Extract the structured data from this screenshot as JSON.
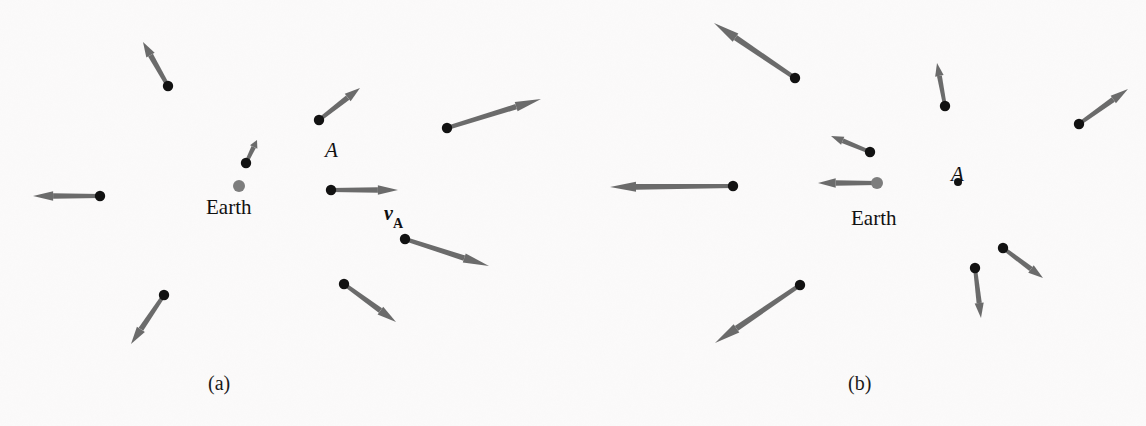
{
  "figure": {
    "background_color": "#fbfafa",
    "galaxy_dot_color": "#121212",
    "earth_dot_color": "#7d7d7d",
    "arrow_color": "#6b6b6b"
  },
  "panels": [
    {
      "id": "a",
      "caption": "(a)",
      "caption_x": 208,
      "caption_y": 372,
      "frame_label": "Earth",
      "labels": [
        {
          "name": "earth-label",
          "text": "Earth",
          "x": 206,
          "y": 197,
          "kind": "earth"
        },
        {
          "name": "galaxy-a-label",
          "text": "A",
          "x": 325,
          "y": 140,
          "kind": "a"
        },
        {
          "name": "velocity-a-label",
          "text": "v",
          "sub": "A",
          "x": 384,
          "y": 203,
          "kind": "v"
        }
      ],
      "earth": {
        "x": 239,
        "y": 186,
        "r": 6,
        "has_arrow": false
      },
      "galaxies": [
        {
          "name": "galaxy-upper-left",
          "x": 168,
          "y": 86,
          "tip_x": 143,
          "tip_y": 42,
          "width": 4.0
        },
        {
          "name": "galaxy-top-middle",
          "x": 319,
          "y": 120,
          "tip_x": 360,
          "tip_y": 88,
          "width": 4.0
        },
        {
          "name": "galaxy-top-right",
          "x": 447,
          "y": 128,
          "tip_x": 541,
          "tip_y": 99,
          "width": 4.0
        },
        {
          "name": "galaxy-near-earth",
          "x": 246,
          "y": 163,
          "tip_x": 257,
          "tip_y": 140,
          "width": 3.4
        },
        {
          "name": "galaxy-left",
          "x": 100,
          "y": 196,
          "tip_x": 33,
          "tip_y": 196,
          "width": 4.0
        },
        {
          "name": "galaxy-a",
          "x": 331,
          "y": 190,
          "tip_x": 398,
          "tip_y": 190,
          "width": 4.0
        },
        {
          "name": "galaxy-right-lower",
          "x": 405,
          "y": 239,
          "tip_x": 489,
          "tip_y": 266,
          "width": 4.0
        },
        {
          "name": "galaxy-bottom-center",
          "x": 344,
          "y": 284,
          "tip_x": 396,
          "tip_y": 322,
          "width": 4.0
        },
        {
          "name": "galaxy-bottom-left",
          "x": 164,
          "y": 295,
          "tip_x": 131,
          "tip_y": 344,
          "width": 4.0
        }
      ]
    },
    {
      "id": "b",
      "caption": "(b)",
      "caption_x": 848,
      "caption_y": 372,
      "frame_label": "Earth",
      "labels": [
        {
          "name": "earth-label",
          "text": "Earth",
          "x": 851,
          "y": 208,
          "kind": "earth"
        },
        {
          "name": "galaxy-a-label",
          "text": "A",
          "x": 951,
          "y": 164,
          "kind": "a"
        }
      ],
      "earth": {
        "x": 877,
        "y": 183,
        "r": 6,
        "has_arrow": true,
        "tip_x": 818,
        "tip_y": 183
      },
      "galaxies": [
        {
          "name": "galaxy-upper-left",
          "x": 795,
          "y": 78,
          "tip_x": 714,
          "tip_y": 23,
          "width": 4.2
        },
        {
          "name": "galaxy-upper-mid",
          "x": 945,
          "y": 106,
          "tip_x": 937,
          "tip_y": 63,
          "width": 3.6
        },
        {
          "name": "galaxy-upper-right",
          "x": 1079,
          "y": 124,
          "tip_x": 1128,
          "tip_y": 89,
          "width": 3.8
        },
        {
          "name": "galaxy-near-earth",
          "x": 870,
          "y": 152,
          "tip_x": 831,
          "tip_y": 136,
          "width": 3.6
        },
        {
          "name": "galaxy-left",
          "x": 733,
          "y": 186,
          "tip_x": 610,
          "tip_y": 187,
          "width": 4.2
        },
        {
          "name": "galaxy-right-lower",
          "x": 1003,
          "y": 248,
          "tip_x": 1043,
          "tip_y": 278,
          "width": 3.8
        },
        {
          "name": "galaxy-lower-center",
          "x": 975,
          "y": 268,
          "tip_x": 981,
          "tip_y": 318,
          "width": 3.8
        },
        {
          "name": "galaxy-bottom-left",
          "x": 800,
          "y": 285,
          "tip_x": 715,
          "tip_y": 343,
          "width": 4.2
        }
      ],
      "stationary_points": [
        {
          "name": "galaxy-a-point",
          "x": 958,
          "y": 182,
          "r": 4
        }
      ]
    }
  ],
  "chart_data": {
    "type": "scatter",
    "panels": [
      "(a)",
      "(b)"
    ],
    "frames": [
      "Earth",
      "A"
    ]
  }
}
